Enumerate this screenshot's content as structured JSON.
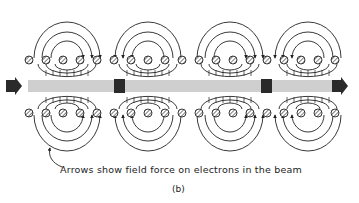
{
  "figure": {
    "caption": "Arrows show field force on electrons in the beam",
    "label": "(b)",
    "colors": {
      "ink": "#222222",
      "beam": "#cfcfcf",
      "bunch": "#2a2a2a",
      "background": "#ffffff"
    },
    "beam": {
      "y": 80,
      "height": 12,
      "x_start": 28,
      "x_end": 338
    },
    "bunches": [
      {
        "x": 114,
        "width": 11
      },
      {
        "x": 261,
        "width": 11
      }
    ],
    "field_groups": [
      {
        "cx": 67,
        "direction": "converge-right"
      },
      {
        "cx": 148,
        "direction": "converge-left"
      },
      {
        "cx": 230,
        "direction": "converge-right"
      },
      {
        "cx": 308,
        "direction": "converge-left"
      }
    ],
    "coil_rows": {
      "top_y": 60,
      "bottom_y": 113
    }
  }
}
